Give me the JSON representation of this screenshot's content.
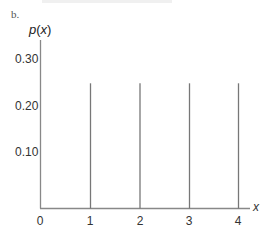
{
  "panel_label": "b.",
  "axes": {
    "ylabel_prefix": "p(",
    "ylabel_var": "x",
    "ylabel_suffix": ")",
    "xlabel": "x",
    "yticks": [
      "0.30",
      "0.20",
      "0.10"
    ],
    "xticks": [
      "0",
      "1",
      "2",
      "3",
      "4"
    ]
  },
  "colors": {
    "axis": "#888888",
    "bar": "#777777",
    "text": "#333333"
  },
  "chart_data": {
    "type": "bar",
    "title": "b.",
    "xlabel": "x",
    "ylabel": "p(x)",
    "categories": [
      "0",
      "1",
      "2",
      "3",
      "4"
    ],
    "x": [
      0,
      1,
      2,
      3,
      4
    ],
    "values": [
      0,
      0.25,
      0.25,
      0.25,
      0.25
    ],
    "ylim": [
      0,
      0.3
    ],
    "yticks": [
      0.1,
      0.2,
      0.3
    ],
    "grid": false,
    "style": "vertical spike lines (probability mass function)"
  }
}
